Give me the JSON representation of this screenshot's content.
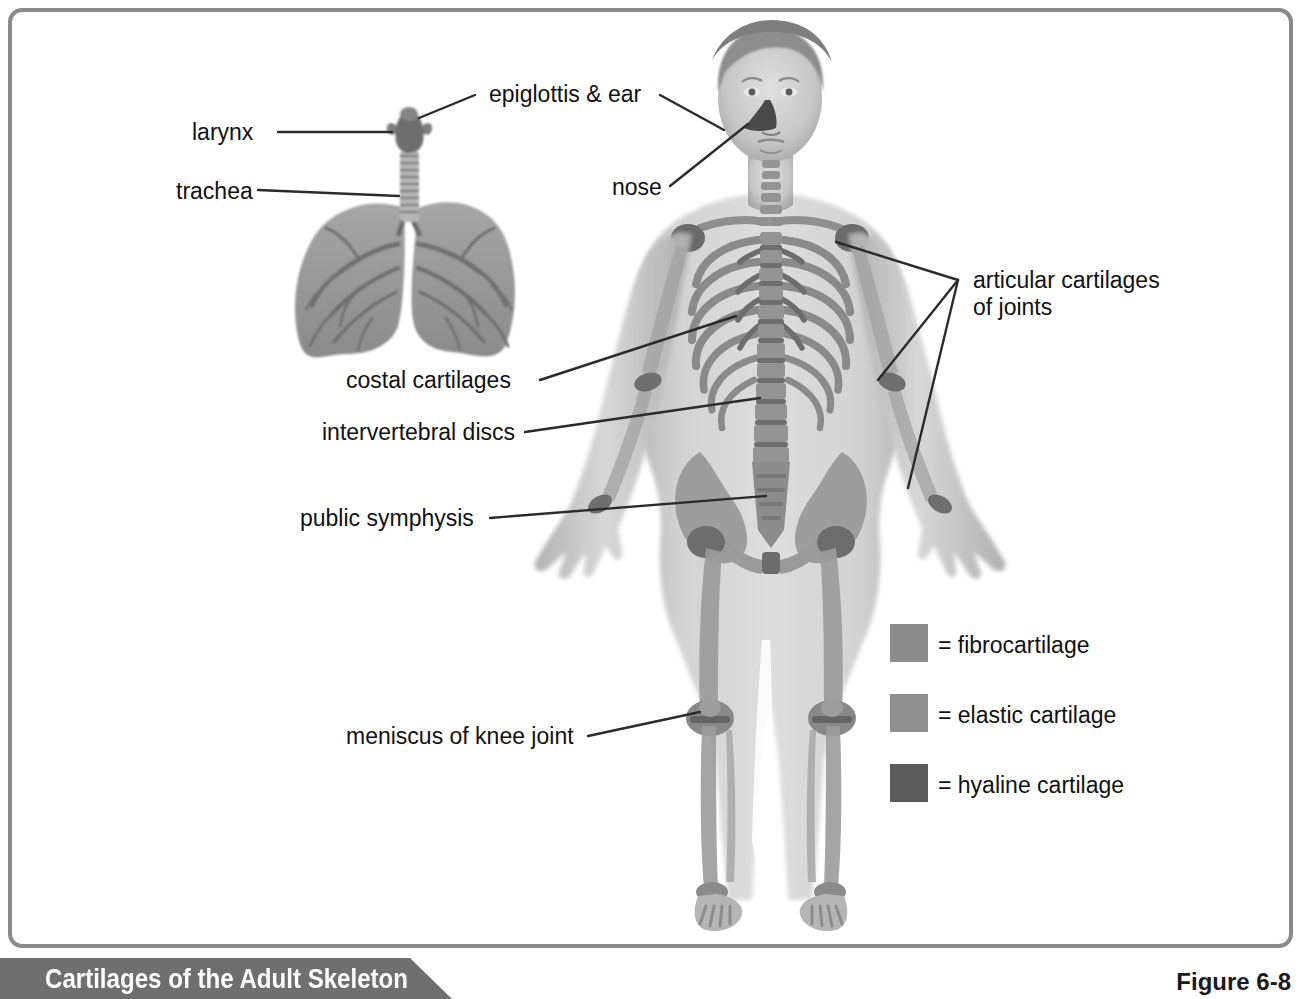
{
  "figure": {
    "banner_title": "Cartilages of the Adult Skeleton",
    "figure_number": "Figure 6-8",
    "banner_color": "#6f6f6f",
    "frame_color": "#8a8a8a",
    "leader_color": "#2b2b2b"
  },
  "labels": {
    "epiglottis_ear": "epiglottis & ear",
    "larynx": "larynx",
    "trachea": "trachea",
    "nose": "nose",
    "articular_line1": "articular cartilages",
    "articular_line2": "of joints",
    "costal": "costal cartilages",
    "intervertebral": "intervertebral discs",
    "pubic": "public symphysis",
    "meniscus": "meniscus of knee joint"
  },
  "legend": {
    "items": [
      {
        "label": "= fibrocartilage",
        "color": "#8c8c8c"
      },
      {
        "label": "= elastic cartilage",
        "color": "#8f8f8f"
      },
      {
        "label": "= hyaline cartilage",
        "color": "#5a5a5a"
      }
    ]
  },
  "anatomy": {
    "body_fill": "#c9c9c9",
    "bone_fill": "#9a9a9a",
    "bone_dark": "#7b7b7b",
    "lung_fill": "#9b9b9b",
    "lung_dark": "#7e7e7e",
    "skin_fill": "#bdbdbd",
    "hair_fill": "#8a8a8a"
  }
}
